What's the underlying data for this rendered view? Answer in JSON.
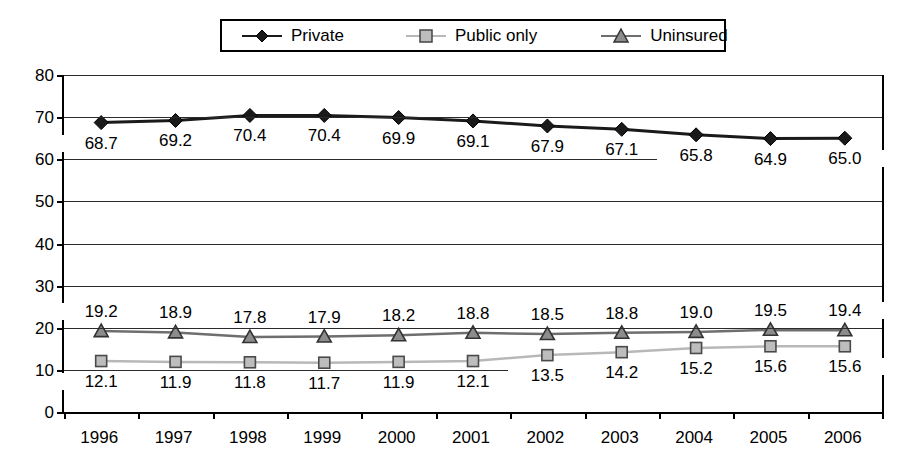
{
  "chart_data": {
    "type": "line",
    "title": "",
    "xlabel": "",
    "ylabel": "",
    "ylim": [
      0,
      80
    ],
    "ytick_step": 10,
    "grid": true,
    "legend_position": "top-center",
    "categories": [
      "1996",
      "1997",
      "1998",
      "1999",
      "2000",
      "2001",
      "2002",
      "2003",
      "2004",
      "2005",
      "2006"
    ],
    "yticks": [
      "80",
      "70",
      "60",
      "50",
      "40",
      "30",
      "20",
      "10",
      "0"
    ],
    "series": [
      {
        "name": "Private",
        "marker": "diamond",
        "line_color": "#1a1a1a",
        "marker_color": "#1a1a1a",
        "label_position": "below",
        "values": [
          68.7,
          69.2,
          70.4,
          70.4,
          69.9,
          69.1,
          67.9,
          67.1,
          65.8,
          64.9,
          65.0
        ],
        "labels": [
          "68.7",
          "69.2",
          "70.4",
          "70.4",
          "69.9",
          "69.1",
          "67.9",
          "67.1",
          "65.8",
          "64.9",
          "65.0"
        ]
      },
      {
        "name": "Public only",
        "marker": "square",
        "line_color": "#b8b8b8",
        "marker_color": "#bdbdbd",
        "label_position": "below",
        "values": [
          12.1,
          11.9,
          11.8,
          11.7,
          11.9,
          12.1,
          13.5,
          14.2,
          15.2,
          15.6,
          15.6
        ],
        "labels": [
          "12.1",
          "11.9",
          "11.8",
          "11.7",
          "11.9",
          "12.1",
          "13.5",
          "14.2",
          "15.2",
          "15.6",
          "15.6"
        ]
      },
      {
        "name": "Uninsured",
        "marker": "triangle",
        "line_color": "#6e6e6e",
        "marker_color": "#8c8c8c",
        "label_position": "above",
        "values": [
          19.2,
          18.9,
          17.8,
          17.9,
          18.2,
          18.8,
          18.5,
          18.8,
          19.0,
          19.5,
          19.4
        ],
        "labels": [
          "19.2",
          "18.9",
          "17.8",
          "17.9",
          "18.2",
          "18.8",
          "18.5",
          "18.8",
          "19.0",
          "19.5",
          "19.4"
        ]
      }
    ]
  },
  "legend": {
    "entries": [
      {
        "label": "Private",
        "icon": "diamond-marker-icon"
      },
      {
        "label": "Public only",
        "icon": "square-marker-icon"
      },
      {
        "label": "Uninsured",
        "icon": "triangle-marker-icon"
      }
    ]
  },
  "colors": {
    "private": "#1a1a1a",
    "public_only": "#bdbdbd",
    "uninsured": "#8c8c8c",
    "grid": "#2a2a2a",
    "axis": "#000000",
    "background": "#ffffff"
  }
}
